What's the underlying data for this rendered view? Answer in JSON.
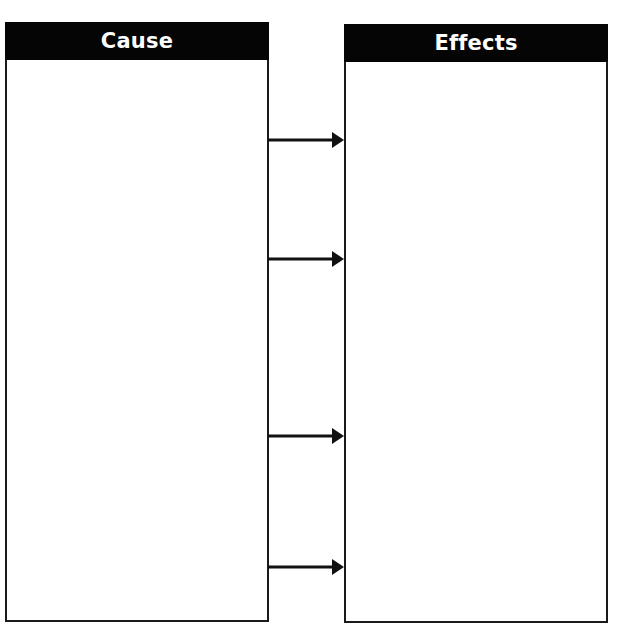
{
  "diagram": {
    "type": "cause-and-effect graphic organizer",
    "colors": {
      "header_background": "#050505",
      "header_text": "#ffffff",
      "border": "#1a1a1a",
      "background": "#ffffff",
      "arrow": "#111111"
    },
    "panels": [
      {
        "id": "cause",
        "title": "Cause",
        "content": ""
      },
      {
        "id": "effects",
        "title": "Effects",
        "content": ""
      }
    ],
    "arrows": [
      {
        "from": "cause",
        "to": "effects",
        "y": 140
      },
      {
        "from": "cause",
        "to": "effects",
        "y": 259
      },
      {
        "from": "cause",
        "to": "effects",
        "y": 436
      },
      {
        "from": "cause",
        "to": "effects",
        "y": 567
      }
    ]
  }
}
